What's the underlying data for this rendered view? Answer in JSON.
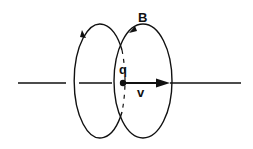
{
  "diagram": {
    "labels": {
      "charge": "q",
      "velocity": "v",
      "field": "B"
    },
    "elements": [
      {
        "name": "axis-line",
        "description": "horizontal line of motion"
      },
      {
        "name": "field-loop-left",
        "description": "magnetic field loop behind the charge, arrow pointing counter-clockwise (down on left)"
      },
      {
        "name": "field-loop-right",
        "description": "magnetic field loop at the charge, arrow near label B"
      },
      {
        "name": "charge-dot",
        "description": "point charge q"
      },
      {
        "name": "velocity-arrow",
        "description": "velocity vector v pointing right"
      }
    ],
    "colors": {
      "stroke": "#111111",
      "background": "#ffffff"
    }
  }
}
